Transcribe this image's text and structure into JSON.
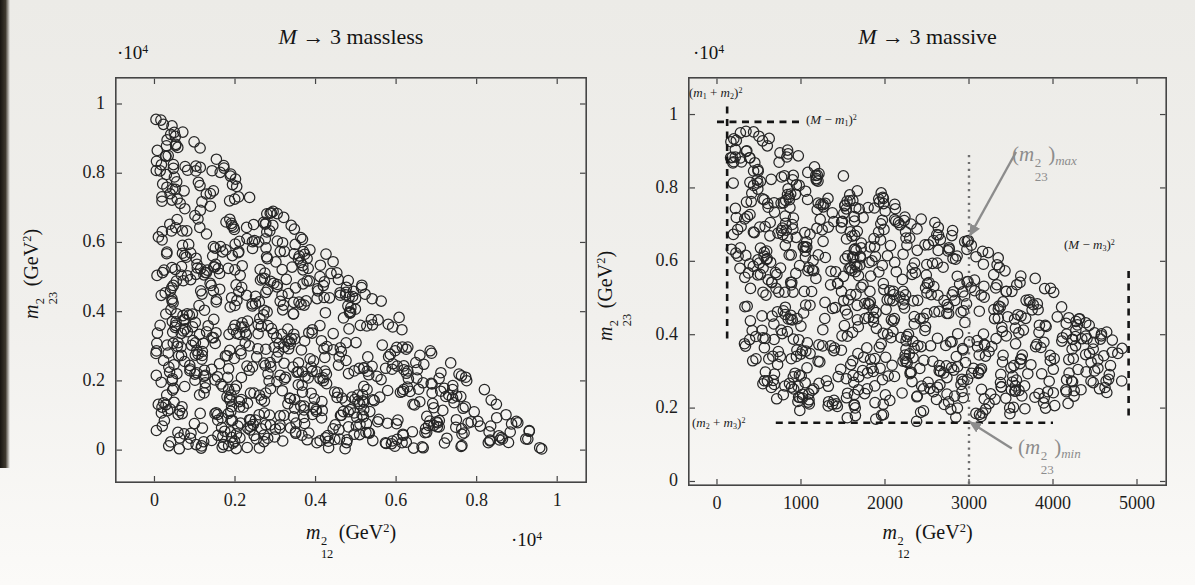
{
  "page": {
    "background_top": "#ecebe7",
    "background_bottom": "#fbfaf8",
    "book_edge_color": "#171410"
  },
  "colors": {
    "frame": "#454545",
    "marker_stroke": "#262626",
    "tick_label": "#1d1d1d",
    "dashed_line": "#141414",
    "dotted_line": "#6f6f6f",
    "gray_annotation": "#8c8c8c",
    "black_annotation": "#1c1c1c"
  },
  "chart_data": [
    {
      "id": "massless",
      "type": "scatter",
      "title": "M → 3 massless",
      "title_segments": [
        [
          "i",
          "M"
        ],
        [
          "t",
          " → 3 massless"
        ]
      ],
      "xlabel": "m²₁₂ (GeV²)",
      "xlabel_segments": [
        [
          "i",
          "m"
        ],
        [
          "st",
          "2",
          "12"
        ],
        [
          "t",
          " (GeV"
        ],
        [
          "S",
          "2"
        ],
        [
          "t",
          ")"
        ]
      ],
      "ylabel": "m²₂₃ (GeV²)",
      "ylabel_segments": [
        [
          "i",
          "m"
        ],
        [
          "st",
          "2",
          "23"
        ],
        [
          "t",
          " (GeV"
        ],
        [
          "S",
          "2"
        ],
        [
          "t",
          ")"
        ]
      ],
      "axis_scale_factor": "·10⁴",
      "scale_segments": [
        [
          "t",
          "·10"
        ],
        [
          "S",
          "4"
        ]
      ],
      "x_ticks": {
        "values": [
          0,
          0.2,
          0.4,
          0.6,
          0.8,
          1
        ],
        "labels": [
          "0",
          "0.2",
          "0.4",
          "0.6",
          "0.8",
          "1"
        ]
      },
      "y_ticks": {
        "values": [
          0,
          0.2,
          0.4,
          0.6,
          0.8,
          1
        ],
        "labels": [
          "0",
          "0.2",
          "0.4",
          "0.6",
          "0.8",
          "1"
        ]
      },
      "xlim": [
        -0.098,
        1.074
      ],
      "ylim": [
        -0.095,
        1.078
      ],
      "units": "axes in 10^4 GeV^2",
      "grid": false,
      "legend": null,
      "marker": {
        "style": "open-circle",
        "radius_px": 5.2
      },
      "points": {
        "n": 800,
        "seed": 20,
        "region": "triangle",
        "rule": "uniform random points over the massless three-body phase-space triangle m12^2 + m23^2 <= 1e4 GeV^2, m12^2>=0, m23^2>=0"
      },
      "box_px": {
        "left": 115,
        "top": 77,
        "width": 472,
        "height": 406
      },
      "layout": {
        "title": [
          115,
          24,
          472
        ],
        "yscale": [
          117,
          42
        ],
        "xlabel": [
          115,
          521,
          472
        ],
        "xscale": [
          511,
          529
        ],
        "ylabel_center": [
          40,
          274
        ]
      }
    },
    {
      "id": "massive",
      "type": "scatter",
      "title": "M → 3 massive",
      "title_segments": [
        [
          "i",
          "M"
        ],
        [
          "t",
          " → 3 massive"
        ]
      ],
      "xlabel": "m²₁₂ (GeV²)",
      "xlabel_segments": [
        [
          "i",
          "m"
        ],
        [
          "st",
          "2",
          "12"
        ],
        [
          "t",
          " (GeV"
        ],
        [
          "S",
          "2"
        ],
        [
          "t",
          ")"
        ]
      ],
      "ylabel": "m²₂₃ (GeV²)",
      "ylabel_segments": [
        [
          "i",
          "m"
        ],
        [
          "st",
          "2",
          "23"
        ],
        [
          "t",
          " (GeV"
        ],
        [
          "S",
          "2"
        ],
        [
          "t",
          ")"
        ]
      ],
      "axis_scale_factor": "·10⁴",
      "scale_segments": [
        [
          "t",
          "·10"
        ],
        [
          "S",
          "4"
        ]
      ],
      "x_ticks": {
        "values": [
          0,
          1000,
          2000,
          3000,
          4000,
          5000
        ],
        "labels": [
          "0",
          "1000",
          "2000",
          "3000",
          "4000",
          "5000"
        ]
      },
      "y_ticks": {
        "values": [
          0,
          2000,
          4000,
          6000,
          8000,
          10000
        ],
        "labels": [
          "0",
          "0.2",
          "0.4",
          "0.6",
          "0.8",
          "1"
        ]
      },
      "xlim": [
        -345,
        5357
      ],
      "ylim": [
        -123,
        11023
      ],
      "units": "x in GeV^2, y in 10^4 GeV^2",
      "grid": false,
      "legend": null,
      "marker": {
        "style": "open-circle",
        "radius_px": 5.2
      },
      "masses": {
        "M": 100,
        "m1": 1,
        "m2": 10,
        "m3": 30
      },
      "kinematic_limits": {
        "m12sq_min": 121,
        "m12sq_max": 4900,
        "m23sq_min": 1600,
        "m23sq_max": 9801
      },
      "points": {
        "n": 800,
        "seed": 11,
        "region": "dalitz",
        "rule": "uniform random points inside the Dalitz boundary for M -> m1 m2 m3 with masses above"
      },
      "guides": [
        {
          "name": "m12sq-min-boundary-dashed",
          "kind": "dashed",
          "x1": 121,
          "y1": 3900,
          "x2": 121,
          "y2": 10260
        },
        {
          "name": "m23sq-max-boundary-dashed",
          "kind": "dashed",
          "x1": 0,
          "y1": 9801,
          "x2": 1000,
          "y2": 9801
        },
        {
          "name": "m23sq-min-boundary-dashed",
          "kind": "dashed",
          "x1": 700,
          "y1": 1600,
          "x2": 4000,
          "y2": 1600
        },
        {
          "name": "m12sq-max-boundary-dashed",
          "kind": "dashed",
          "x1": 4900,
          "y1": 1800,
          "x2": 4900,
          "y2": 5800
        },
        {
          "name": "m12sq-3000-dotted",
          "kind": "dotted",
          "x1": 3000,
          "y1": -60,
          "x2": 3000,
          "y2": 8950
        }
      ],
      "arrows": [
        {
          "name": "m23sq-max-arrow",
          "from": [
            3560,
            8980
          ],
          "to": [
            3010,
            6700
          ],
          "points_to": "(m23^2)max on upper Dalitz boundary at m12^2 = 3000"
        },
        {
          "name": "m23sq-min-arrow",
          "from": [
            3510,
            900
          ],
          "to": [
            3010,
            1620
          ],
          "points_to": "(m23^2)min on lower Dalitz boundary at m12^2 = 3000"
        }
      ],
      "annotations": [
        {
          "name": "label-m1-plus-m2-squared",
          "text": "(m₁ + m₂)²",
          "style": "black",
          "size": 13,
          "pos_px": [
            689,
            86
          ],
          "segments": [
            [
              "t",
              "("
            ],
            [
              "i",
              "m"
            ],
            [
              "s",
              "1"
            ],
            [
              "t",
              " + "
            ],
            [
              "i",
              "m"
            ],
            [
              "s",
              "2"
            ],
            [
              "t",
              ")"
            ],
            [
              "S",
              "2"
            ]
          ]
        },
        {
          "name": "label-M-minus-m1-squared",
          "text": "(M − m₁)²",
          "style": "black",
          "size": 13,
          "pos_px": [
            806,
            113
          ],
          "segments": [
            [
              "t",
              "("
            ],
            [
              "i",
              "M"
            ],
            [
              "t",
              " − "
            ],
            [
              "i",
              "m"
            ],
            [
              "s",
              "1"
            ],
            [
              "t",
              ")"
            ],
            [
              "S",
              "2"
            ]
          ]
        },
        {
          "name": "label-m23sq-max",
          "text": "(m²₂₃)max",
          "style": "gray",
          "size": 21,
          "pos_px": [
            1012,
            143
          ],
          "segments": [
            [
              "t",
              "("
            ],
            [
              "i",
              "m"
            ],
            [
              "st",
              "2",
              "23"
            ],
            [
              "t",
              ")"
            ],
            [
              "si",
              "max"
            ]
          ]
        },
        {
          "name": "label-M-minus-m3-squared",
          "text": "(M − m₃)²",
          "style": "black",
          "size": 13,
          "pos_px": [
            1064,
            238
          ],
          "segments": [
            [
              "t",
              "("
            ],
            [
              "i",
              "M"
            ],
            [
              "t",
              " − "
            ],
            [
              "i",
              "m"
            ],
            [
              "s",
              "3"
            ],
            [
              "t",
              ")"
            ],
            [
              "S",
              "2"
            ]
          ]
        },
        {
          "name": "label-m2-plus-m3-squared",
          "text": "(m₂ + m₃)²",
          "style": "black",
          "size": 13,
          "pos_px": [
            692,
            416
          ],
          "segments": [
            [
              "t",
              "("
            ],
            [
              "i",
              "m"
            ],
            [
              "s",
              "2"
            ],
            [
              "t",
              " + "
            ],
            [
              "i",
              "m"
            ],
            [
              "s",
              "3"
            ],
            [
              "t",
              ")"
            ],
            [
              "S",
              "2"
            ]
          ]
        },
        {
          "name": "label-m23sq-min",
          "text": "(m²₂₃)min",
          "style": "gray",
          "size": 21,
          "pos_px": [
            1018,
            436
          ],
          "segments": [
            [
              "t",
              "("
            ],
            [
              "i",
              "m"
            ],
            [
              "st",
              "2",
              "23"
            ],
            [
              "t",
              ")"
            ],
            [
              "si",
              "min"
            ]
          ]
        }
      ],
      "box_px": {
        "left": 688,
        "top": 77,
        "width": 479,
        "height": 409
      },
      "layout": {
        "title": [
          688,
          24,
          479
        ],
        "yscale": [
          693,
          42
        ],
        "xlabel": [
          688,
          521,
          479
        ],
        "xscale": null,
        "ylabel_center": [
          614,
          296
        ]
      }
    }
  ]
}
